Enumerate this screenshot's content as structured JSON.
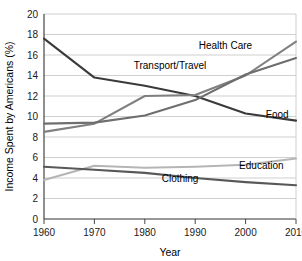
{
  "chart_data": {
    "type": "line",
    "title": "",
    "xlabel": "Year",
    "ylabel": "Income Spent by Americans (%)",
    "x": [
      1960,
      1970,
      1980,
      1990,
      2000,
      2010
    ],
    "xtick_labels": [
      "1960",
      "1970",
      "1980",
      "1990",
      "2000",
      "2010"
    ],
    "ytick_labels": [
      "0",
      "2",
      "4",
      "6",
      "8",
      "10",
      "12",
      "14",
      "16",
      "18",
      "20"
    ],
    "yticks": [
      0,
      2,
      4,
      6,
      8,
      10,
      12,
      14,
      16,
      18,
      20
    ],
    "xlim": [
      1960,
      2010
    ],
    "ylim": [
      0,
      20
    ],
    "grid": "horizontal",
    "legend": "inline-labels",
    "series": [
      {
        "name": "Food",
        "label": "Food",
        "color": "#3a3a3a",
        "width": 2.1,
        "values": [
          17.6,
          13.8,
          13.0,
          12.0,
          10.3,
          9.6
        ],
        "label_x": 2001,
        "label_y": 9.9
      },
      {
        "name": "Health Care",
        "label": "Health Care",
        "color": "#808080",
        "width": 2.1,
        "values": [
          8.5,
          9.3,
          12.0,
          12.1,
          14.0,
          17.3
        ],
        "label_x": 1996,
        "label_y": 16.6
      },
      {
        "name": "Transport/Travel",
        "label": "Transport/Travel",
        "color": "#6e6e6e",
        "width": 2.1,
        "values": [
          9.3,
          9.4,
          10.1,
          11.6,
          14.1,
          15.7
        ],
        "label_x": 1985,
        "label_y": 14.6
      },
      {
        "name": "Education",
        "label": "Education",
        "color": "#b5b5b5",
        "width": 2.1,
        "values": [
          3.8,
          5.2,
          5.0,
          5.1,
          5.3,
          5.9
        ],
        "label_x": 2000,
        "label_y": 4.9
      },
      {
        "name": "Clothing",
        "label": "Clothing",
        "color": "#585858",
        "width": 2.1,
        "values": [
          5.1,
          4.8,
          4.5,
          4.0,
          3.6,
          3.3
        ],
        "label_x": 1987,
        "label_y": 3.6
      }
    ],
    "style": {
      "axis_color": "#333333",
      "grid_color": "#c9c9c9",
      "background": "#ffffff"
    }
  }
}
